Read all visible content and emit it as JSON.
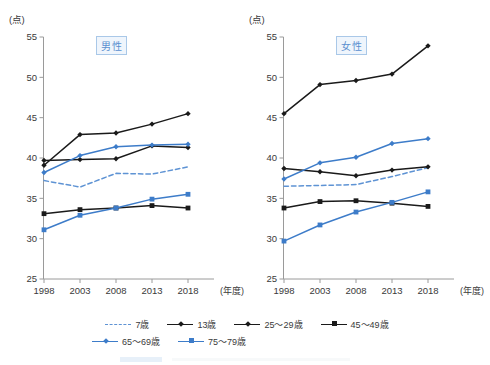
{
  "figure": {
    "y_unit_label": "(点)",
    "x_unit_label": "(年度)"
  },
  "panels": [
    {
      "id": "male",
      "title": "男性"
    },
    {
      "id": "female",
      "title": "女性"
    }
  ],
  "legend": {
    "items": [
      {
        "label": "7歳",
        "color": "#5e93d4",
        "style": "dashed",
        "marker": "none"
      },
      {
        "label": "13歳",
        "color": "#1a1a1a",
        "style": "solid",
        "marker": "diamond"
      },
      {
        "label": "25〜29歳",
        "color": "#1a1a1a",
        "style": "solid",
        "marker": "diamond"
      },
      {
        "label": "45〜49歳",
        "color": "#1a1a1a",
        "style": "solid",
        "marker": "square"
      },
      {
        "label": "65〜69歳",
        "color": "#3d7cc9",
        "style": "solid",
        "marker": "diamond"
      },
      {
        "label": "75〜79歳",
        "color": "#3d7cc9",
        "style": "solid",
        "marker": "square"
      }
    ]
  },
  "colors": {
    "black_series": "#1a1a1a",
    "blue_series": "#3d7cc9",
    "dashed_blue": "#5e93d4",
    "axis": "#9a9a9a",
    "title_box_border": "#a9c8e8",
    "title_box_fill": "#eff5fc",
    "title_text": "#5a8fcf"
  },
  "chart_data": [
    {
      "type": "line",
      "title": "男性",
      "xlabel": "(年度)",
      "ylabel": "(点)",
      "x": [
        1998,
        2003,
        2008,
        2013,
        2018
      ],
      "xtick_labels": [
        "1998",
        "2003",
        "2008",
        "2013",
        "2018"
      ],
      "ytick_labels": [
        "25",
        "30",
        "35",
        "40",
        "45",
        "50",
        "55"
      ],
      "ylim": [
        25,
        55
      ],
      "grid": false,
      "legend_position": "bottom",
      "series": [
        {
          "name": "7歳",
          "values": [
            37.2,
            36.4,
            38.1,
            38.0,
            38.9
          ],
          "color": "#5e93d4",
          "style": "dashed",
          "marker": "none"
        },
        {
          "name": "13歳",
          "values": [
            39.1,
            42.9,
            43.1,
            44.2,
            45.5
          ],
          "color": "#1a1a1a",
          "style": "solid",
          "marker": "diamond"
        },
        {
          "name": "25〜29歳",
          "values": [
            39.7,
            39.8,
            39.9,
            41.5,
            41.3
          ],
          "color": "#1a1a1a",
          "style": "solid",
          "marker": "diamond"
        },
        {
          "name": "45〜49歳",
          "values": [
            33.1,
            33.6,
            33.8,
            34.1,
            33.8
          ],
          "color": "#1a1a1a",
          "style": "solid",
          "marker": "square"
        },
        {
          "name": "65〜69歳",
          "values": [
            38.2,
            40.3,
            41.4,
            41.6,
            41.7
          ],
          "color": "#3d7cc9",
          "style": "solid",
          "marker": "diamond"
        },
        {
          "name": "75〜79歳",
          "values": [
            31.1,
            32.9,
            33.8,
            34.9,
            35.5
          ],
          "color": "#3d7cc9",
          "style": "solid",
          "marker": "square"
        }
      ]
    },
    {
      "type": "line",
      "title": "女性",
      "xlabel": "(年度)",
      "ylabel": "(点)",
      "x": [
        1998,
        2003,
        2008,
        2013,
        2018
      ],
      "xtick_labels": [
        "1998",
        "2003",
        "2008",
        "2013",
        "2018"
      ],
      "ytick_labels": [
        "25",
        "30",
        "35",
        "40",
        "45",
        "50",
        "55"
      ],
      "ylim": [
        25,
        55
      ],
      "grid": false,
      "legend_position": "bottom",
      "series": [
        {
          "name": "7歳",
          "values": [
            36.5,
            36.6,
            36.7,
            37.7,
            38.8
          ],
          "color": "#5e93d4",
          "style": "dashed",
          "marker": "none"
        },
        {
          "name": "13歳",
          "values": [
            45.5,
            49.1,
            49.6,
            50.4,
            53.9
          ],
          "color": "#1a1a1a",
          "style": "solid",
          "marker": "diamond"
        },
        {
          "name": "25〜29歳",
          "values": [
            38.7,
            38.3,
            37.8,
            38.5,
            38.9
          ],
          "color": "#1a1a1a",
          "style": "solid",
          "marker": "diamond"
        },
        {
          "name": "45〜49歳",
          "values": [
            33.8,
            34.6,
            34.7,
            34.4,
            34.0
          ],
          "color": "#1a1a1a",
          "style": "solid",
          "marker": "square"
        },
        {
          "name": "65〜69歳",
          "values": [
            37.4,
            39.4,
            40.1,
            41.8,
            42.4
          ],
          "color": "#3d7cc9",
          "style": "solid",
          "marker": "diamond"
        },
        {
          "name": "75〜79歳",
          "values": [
            29.7,
            31.7,
            33.3,
            34.5,
            35.8
          ],
          "color": "#3d7cc9",
          "style": "solid",
          "marker": "square"
        }
      ]
    }
  ]
}
